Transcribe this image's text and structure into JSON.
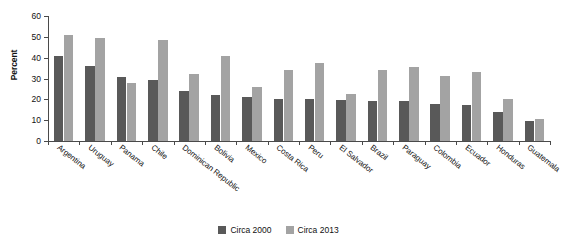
{
  "chart_data": {
    "type": "bar",
    "title": "",
    "subtitle": "",
    "xlabel": "",
    "ylabel": "Percent",
    "ylim": [
      0,
      60
    ],
    "yticks": [
      0,
      10,
      20,
      30,
      40,
      50,
      60
    ],
    "grid": false,
    "legend_position": "bottom-center",
    "categories": [
      "Argentina",
      "Uruguay",
      "Panama",
      "Chile",
      "Dominican Republic",
      "Bolivia",
      "Mexico",
      "Costa Rica",
      "Peru",
      "El Salvador",
      "Brazil",
      "Paraguay",
      "Colombia",
      "Ecuador",
      "Honduras",
      "Guatemala"
    ],
    "series": [
      {
        "name": "Circa 2000",
        "color": "#595959",
        "values": [
          41,
          36,
          30.5,
          29.5,
          24,
          22,
          21,
          20,
          20,
          19.5,
          19,
          19,
          18,
          17.5,
          14,
          9.5
        ]
      },
      {
        "name": "Circa 2013",
        "color": "#a3a3a3",
        "values": [
          51,
          49.5,
          28,
          48.5,
          32,
          41,
          26,
          34,
          37.5,
          22.5,
          34,
          35.5,
          31,
          33,
          20,
          10.5
        ]
      }
    ]
  },
  "legend": {
    "items": [
      {
        "label": "Circa 2000",
        "color": "#595959"
      },
      {
        "label": "Circa 2013",
        "color": "#a3a3a3"
      }
    ]
  }
}
